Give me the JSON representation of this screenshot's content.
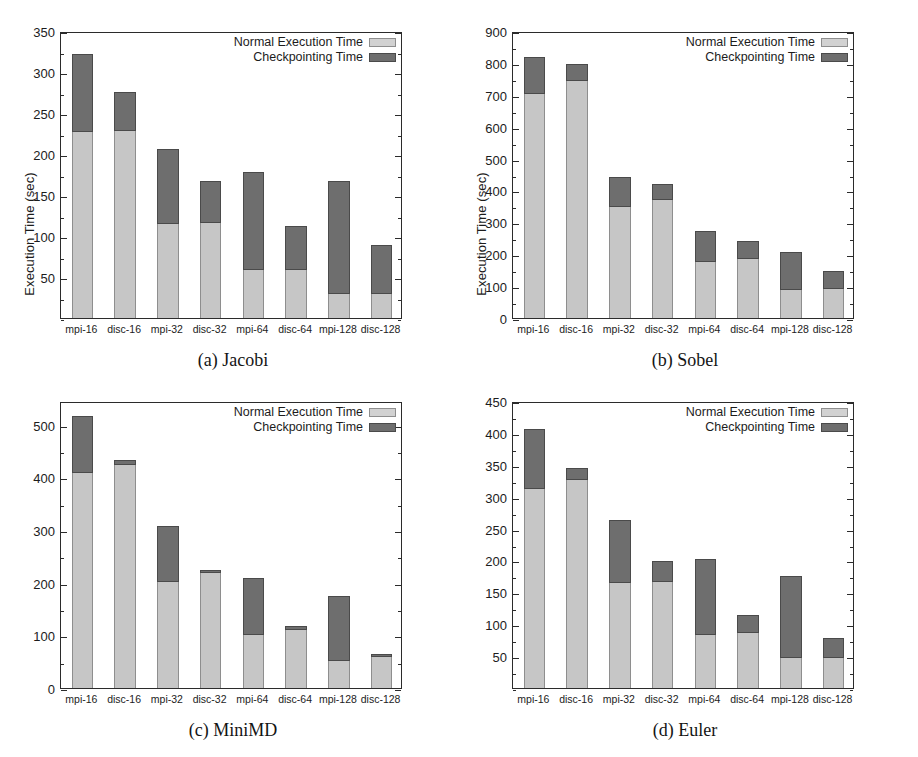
{
  "figure": {
    "ylabel": "Execution Time (sec)",
    "legend": {
      "normal_label": "Normal Execution Time",
      "ckpt_label": "Checkpointing Time",
      "normal_color": "#d2d2d2",
      "ckpt_color": "#6e6e6e",
      "position": "top-right-inside"
    },
    "categories": [
      "mpi-16",
      "disc-16",
      "mpi-32",
      "disc-32",
      "mpi-64",
      "disc-64",
      "mpi-128",
      "disc-128"
    ],
    "captions": {
      "a": "(a) Jacobi",
      "b": "(b) Sobel",
      "c": "(c) MiniMD",
      "d": "(d) Euler"
    }
  },
  "chart_data": [
    {
      "id": "a",
      "type": "bar",
      "stacked": true,
      "title": "(a) Jacobi",
      "xlabel": "",
      "ylabel": "Execution Time (sec)",
      "ylim": [
        0,
        350
      ],
      "ytick_step": 50,
      "yticks": [
        50,
        100,
        150,
        200,
        250,
        300,
        350
      ],
      "grid": false,
      "categories": [
        "mpi-16",
        "disc-16",
        "mpi-32",
        "disc-32",
        "mpi-64",
        "disc-64",
        "mpi-128",
        "disc-128"
      ],
      "series": [
        {
          "name": "Normal Execution Time",
          "values": [
            229,
            230,
            117,
            118,
            61,
            61,
            32,
            32
          ]
        },
        {
          "name": "Checkpointing Time",
          "values": [
            96,
            48,
            91,
            52,
            119,
            54,
            138,
            59
          ]
        }
      ],
      "totals": [
        325,
        278,
        208,
        170,
        180,
        115,
        170,
        91
      ]
    },
    {
      "id": "b",
      "type": "bar",
      "stacked": true,
      "title": "(b) Sobel",
      "xlabel": "",
      "ylabel": "Execution Time (sec)",
      "ylim": [
        0,
        900
      ],
      "ytick_step": 100,
      "yticks": [
        0,
        100,
        200,
        300,
        400,
        500,
        600,
        700,
        800,
        900
      ],
      "grid": false,
      "categories": [
        "mpi-16",
        "disc-16",
        "mpi-32",
        "disc-32",
        "mpi-64",
        "disc-64",
        "mpi-128",
        "disc-128"
      ],
      "series": [
        {
          "name": "Normal Execution Time",
          "values": [
            710,
            748,
            355,
            376,
            182,
            192,
            95,
            98
          ]
        },
        {
          "name": "Checkpointing Time",
          "values": [
            115,
            54,
            95,
            51,
            98,
            56,
            117,
            56
          ]
        }
      ],
      "totals": [
        825,
        802,
        450,
        427,
        280,
        248,
        212,
        154
      ]
    },
    {
      "id": "c",
      "type": "bar",
      "stacked": true,
      "title": "(c) MiniMD",
      "xlabel": "",
      "ylabel": "Execution Time (sec)",
      "ylim": [
        0,
        545
      ],
      "ytick_step": 100,
      "yticks": [
        0,
        100,
        200,
        300,
        400,
        500
      ],
      "grid": false,
      "categories": [
        "mpi-16",
        "disc-16",
        "mpi-32",
        "disc-32",
        "mpi-64",
        "disc-64",
        "mpi-128",
        "disc-128"
      ],
      "series": [
        {
          "name": "Normal Execution Time",
          "values": [
            413,
            427,
            206,
            222,
            105,
            114,
            56,
            63
          ]
        },
        {
          "name": "Checkpointing Time",
          "values": [
            107,
            9,
            105,
            6,
            107,
            8,
            123,
            6
          ]
        }
      ],
      "totals": [
        520,
        436,
        311,
        228,
        212,
        122,
        179,
        69
      ]
    },
    {
      "id": "d",
      "type": "bar",
      "stacked": true,
      "title": "(d) Euler",
      "xlabel": "",
      "ylabel": "Execution Time (sec)",
      "ylim": [
        0,
        450
      ],
      "ytick_step": 50,
      "yticks": [
        50,
        100,
        150,
        200,
        250,
        300,
        350,
        400,
        450
      ],
      "grid": false,
      "categories": [
        "mpi-16",
        "disc-16",
        "mpi-32",
        "disc-32",
        "mpi-64",
        "disc-64",
        "mpi-128",
        "disc-128"
      ],
      "series": [
        {
          "name": "Normal Execution Time",
          "values": [
            315,
            329,
            167,
            169,
            87,
            90,
            50,
            50
          ]
        },
        {
          "name": "Checkpointing Time",
          "values": [
            94,
            19,
            99,
            33,
            118,
            27,
            128,
            32
          ]
        }
      ],
      "totals": [
        409,
        348,
        266,
        202,
        205,
        117,
        178,
        82
      ]
    }
  ]
}
